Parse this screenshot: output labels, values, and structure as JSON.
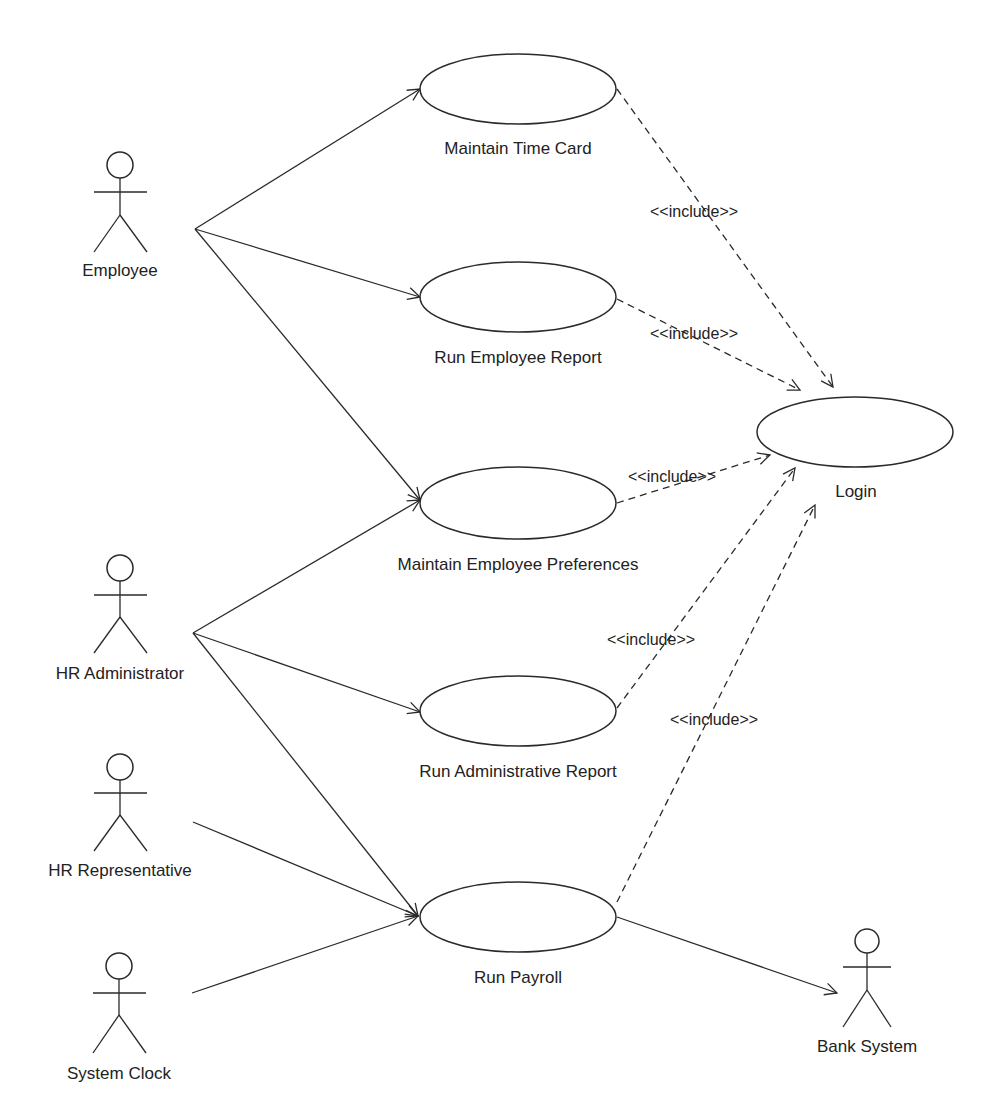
{
  "diagram": {
    "type": "UML use case diagram",
    "actors": [
      {
        "id": "employee",
        "label": "Employee",
        "x": 120,
        "y": 165
      },
      {
        "id": "hr_admin",
        "label": "HR Administrator",
        "x": 120,
        "y": 568
      },
      {
        "id": "hr_rep",
        "label": "HR Representative",
        "x": 120,
        "y": 767
      },
      {
        "id": "system_clock",
        "label": "System Clock",
        "x": 119,
        "y": 966
      },
      {
        "id": "bank_system",
        "label": "Bank System",
        "x": 867,
        "y": 941
      }
    ],
    "use_cases": [
      {
        "id": "maintain_time_card",
        "label": "Maintain Time Card",
        "cx": 518,
        "cy": 89
      },
      {
        "id": "run_employee_report",
        "label": "Run Employee Report",
        "cx": 518,
        "cy": 297
      },
      {
        "id": "maintain_employee_preferences",
        "label": "Maintain Employee Preferences",
        "cx": 518,
        "cy": 503
      },
      {
        "id": "run_administrative_report",
        "label": "Run Administrative Report",
        "cx": 518,
        "cy": 710
      },
      {
        "id": "run_payroll",
        "label": "Run Payroll",
        "cx": 518,
        "cy": 917
      },
      {
        "id": "login",
        "label": "Login",
        "cx": 855,
        "cy": 432
      }
    ],
    "associations": [
      {
        "from": "employee",
        "to": "maintain_time_card"
      },
      {
        "from": "employee",
        "to": "run_employee_report"
      },
      {
        "from": "employee",
        "to": "maintain_employee_preferences"
      },
      {
        "from": "hr_admin",
        "to": "maintain_employee_preferences"
      },
      {
        "from": "hr_admin",
        "to": "run_administrative_report"
      },
      {
        "from": "hr_admin",
        "to": "run_payroll"
      },
      {
        "from": "hr_rep",
        "to": "run_payroll"
      },
      {
        "from": "system_clock",
        "to": "run_payroll"
      },
      {
        "from": "run_payroll",
        "to": "bank_system"
      }
    ],
    "includes": [
      {
        "from": "maintain_time_card",
        "to": "login",
        "label": "<<include>>"
      },
      {
        "from": "run_employee_report",
        "to": "login",
        "label": "<<include>>"
      },
      {
        "from": "maintain_employee_preferences",
        "to": "login",
        "label": "<<include>>"
      },
      {
        "from": "run_administrative_report",
        "to": "login",
        "label": "<<include>>"
      },
      {
        "from": "run_payroll",
        "to": "login",
        "label": "<<include>>"
      }
    ]
  },
  "labels": {
    "employee": "Employee",
    "hr_admin": "HR Administrator",
    "hr_rep": "HR Representative",
    "system_clock": "System Clock",
    "bank_system": "Bank System",
    "maintain_time_card": "Maintain Time Card",
    "run_employee_report": "Run Employee Report",
    "maintain_employee_preferences": "Maintain Employee Preferences",
    "run_administrative_report": "Run Administrative Report",
    "run_payroll": "Run Payroll",
    "login": "Login",
    "include": "<<include>>"
  },
  "colors": {
    "stroke": "#2a2a2a",
    "text": "#222222",
    "background": "#ffffff"
  }
}
